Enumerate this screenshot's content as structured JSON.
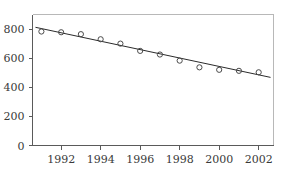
{
  "chart_data": {
    "type": "scatter",
    "title": "",
    "subtitle": "",
    "xlabel": "",
    "ylabel": "",
    "x": [
      1991,
      1992,
      1993,
      1994,
      1995,
      1996,
      1997,
      1998,
      1999,
      2000,
      2001,
      2002
    ],
    "values": [
      783,
      778,
      765,
      730,
      700,
      650,
      625,
      583,
      537,
      520,
      513,
      503
    ],
    "series": [
      {
        "name": "observed",
        "values": [
          783,
          778,
          765,
          730,
          700,
          650,
          625,
          583,
          537,
          520,
          513,
          503
        ],
        "marker": "open-circle"
      },
      {
        "name": "trend",
        "type": "line",
        "endpoints": [
          [
            1990.7,
            812
          ],
          [
            2002.6,
            468
          ]
        ]
      }
    ],
    "xlim": [
      1990.55,
      2002.75
    ],
    "ylim": [
      0,
      900
    ],
    "xticks": [
      1992,
      1994,
      1996,
      1998,
      2000,
      2002
    ],
    "xtick_labels": [
      "1992",
      "1994",
      "1996",
      "1998",
      "2000",
      "2002"
    ],
    "yticks": [
      0,
      200,
      400,
      600,
      800
    ],
    "ytick_labels": [
      "0",
      "200",
      "400",
      "600",
      "800"
    ],
    "grid": false,
    "legend": null,
    "annotations": []
  },
  "colors": {
    "background": "#ffffff",
    "axis": "#5a5a5a",
    "frame": "#b8b8b8",
    "trend": "#2b2b2b",
    "marker": "#4a4a4a",
    "text": "#3a3a3a"
  }
}
